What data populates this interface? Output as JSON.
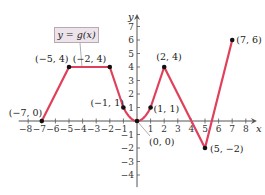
{
  "chart_data": {
    "type": "line",
    "title": "",
    "legend": "y = g(x)",
    "xlabel": "x",
    "ylabel": "y",
    "xlim": [
      -8,
      8
    ],
    "ylim": [
      -4,
      7
    ],
    "grid": false,
    "x_ticks": [
      -8,
      -7,
      -6,
      -5,
      -4,
      -3,
      -2,
      -1,
      1,
      2,
      3,
      4,
      5,
      6,
      7,
      8
    ],
    "y_ticks": [
      -4,
      -3,
      -2,
      -1,
      1,
      2,
      3,
      4,
      5,
      6,
      7
    ],
    "series": [
      {
        "name": "y = g(x)",
        "color": "#e0405a",
        "segments": [
          {
            "kind": "linear",
            "points": [
              [
                -7,
                0
              ],
              [
                -5,
                4
              ],
              [
                -2,
                4
              ],
              [
                -1,
                1
              ]
            ]
          },
          {
            "kind": "parabola",
            "formula": "y = x^2",
            "domain": [
              -1,
              1
            ]
          },
          {
            "kind": "linear",
            "points": [
              [
                1,
                1
              ],
              [
                2,
                4
              ],
              [
                5,
                -2
              ],
              [
                7,
                6
              ]
            ]
          }
        ]
      }
    ],
    "labeled_points": [
      {
        "x": -7,
        "y": 0,
        "label": "(−7, 0)"
      },
      {
        "x": -5,
        "y": 4,
        "label": "(−5, 4)"
      },
      {
        "x": -2,
        "y": 4,
        "label": "(−2, 4)"
      },
      {
        "x": -1,
        "y": 1,
        "label": "(−1, 1)"
      },
      {
        "x": 0,
        "y": 0,
        "label": "(0, 0)"
      },
      {
        "x": 1,
        "y": 1,
        "label": "(1, 1)"
      },
      {
        "x": 2,
        "y": 4,
        "label": "(2, 4)"
      },
      {
        "x": 5,
        "y": -2,
        "label": "(5, −2)"
      },
      {
        "x": 7,
        "y": 6,
        "label": "(7, 6)"
      }
    ]
  },
  "legend": {
    "label": "y = g(x)"
  },
  "axes": {
    "x_label": "x",
    "y_label": "y"
  },
  "colors": {
    "curve": "#e0405a",
    "axis": "#555555",
    "point": "#111111",
    "legend_bg": "#ece4ea"
  }
}
